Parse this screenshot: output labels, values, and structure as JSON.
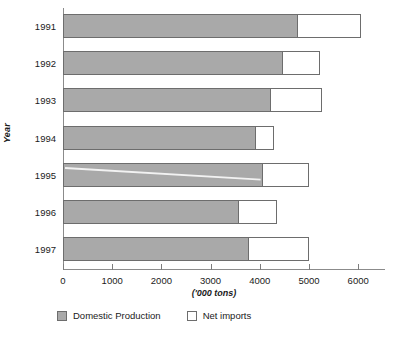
{
  "chart_data": {
    "type": "bar",
    "orientation": "horizontal",
    "stacked": true,
    "title": "",
    "xlabel": "('000 tons)",
    "ylabel": "Year",
    "categories": [
      "1991",
      "1992",
      "1993",
      "1994",
      "1995",
      "1996",
      "1997"
    ],
    "series": [
      {
        "name": "Domestic Production",
        "color": "#a9a9a9",
        "values": [
          4750,
          4450,
          4200,
          3900,
          4050,
          3550,
          3750
        ]
      },
      {
        "name": "Net imports",
        "color": "#ffffff",
        "values": [
          1300,
          780,
          1070,
          390,
          950,
          800,
          1250
        ]
      }
    ],
    "totals": [
      6050,
      5230,
      5270,
      4290,
      5000,
      4350,
      5000
    ],
    "xlim": [
      0,
      6550
    ],
    "xticks": [
      0,
      1000,
      2000,
      3000,
      4000,
      5000,
      6000
    ],
    "xtick_labels": [
      "0",
      "1000",
      "2000",
      "3000",
      "4000",
      "5000",
      "6000"
    ],
    "grid": false,
    "legend_position": "bottom-left"
  },
  "legend": {
    "entries": [
      {
        "label": "Domestic Production",
        "swatch": "domestic"
      },
      {
        "label": "Net imports",
        "swatch": "imports"
      }
    ]
  }
}
